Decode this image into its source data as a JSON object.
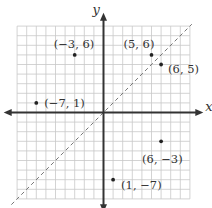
{
  "diagram": {
    "type": "coordinate-plane",
    "axes": {
      "x_label": "x",
      "y_label": "y",
      "range": [
        -9,
        9
      ]
    },
    "grid": true,
    "reference_line": {
      "equation": "y = x",
      "style": "dashed"
    },
    "points": [
      {
        "x": -3,
        "y": 6,
        "label": "(−3, 6)"
      },
      {
        "x": 5,
        "y": 6,
        "label": "(5, 6)"
      },
      {
        "x": 6,
        "y": 5,
        "label": "(6, 5)"
      },
      {
        "x": -7,
        "y": 1,
        "label": "(−7, 1)"
      },
      {
        "x": 6,
        "y": -3,
        "label": "(6, −3)"
      },
      {
        "x": 1,
        "y": -7,
        "label": "(1, −7)"
      }
    ]
  },
  "chart_data": {
    "type": "scatter",
    "title": "",
    "xlabel": "x",
    "ylabel": "y",
    "xlim": [
      -9,
      9
    ],
    "ylim": [
      -9,
      9
    ],
    "grid": true,
    "series": [
      {
        "name": "points",
        "x": [
          -3,
          5,
          6,
          -7,
          6,
          1
        ],
        "y": [
          6,
          6,
          5,
          1,
          -3,
          -7
        ],
        "labels": [
          "(−3, 6)",
          "(5, 6)",
          "(6, 5)",
          "(−7, 1)",
          "(6, −3)",
          "(1, −7)"
        ]
      },
      {
        "name": "y = x",
        "type": "line",
        "style": "dashed",
        "x": [
          -9,
          9
        ],
        "y": [
          -9,
          9
        ]
      }
    ]
  },
  "colors": {
    "grid": "#c8c8c8",
    "axis": "#333333",
    "point": "#222222",
    "dashed_line": "#777777"
  }
}
